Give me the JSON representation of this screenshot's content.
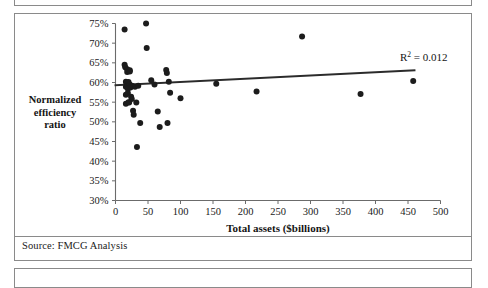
{
  "document": {
    "source_note": "Source: FMCG Analysis"
  },
  "chart_data": {
    "type": "scatter",
    "title": "",
    "xlabel": "Total assets ($billions)",
    "ylabel": "Normalized efficiency ratio",
    "ylabel_lines": [
      "Normalized",
      "efficiency",
      "ratio"
    ],
    "xlim": [
      0,
      500
    ],
    "ylim": [
      30,
      75
    ],
    "xticks": [
      0,
      50,
      100,
      150,
      200,
      250,
      300,
      350,
      400,
      450,
      500
    ],
    "xtick_labels": [
      "0",
      "50",
      "100",
      "150",
      "200",
      "250",
      "300",
      "350",
      "400",
      "450",
      "500"
    ],
    "yticks": [
      30,
      35,
      40,
      45,
      50,
      55,
      60,
      65,
      70,
      75
    ],
    "ytick_labels": [
      "30%",
      "35%",
      "40%",
      "45%",
      "50%",
      "55%",
      "60%",
      "65%",
      "70%",
      "75%"
    ],
    "grid": false,
    "legend": false,
    "annotations": [
      {
        "name": "r2-annotation",
        "text_prefix": "R",
        "text_sup": "2",
        "text_suffix": " = 0.012",
        "value": 0.012
      }
    ],
    "trendline": {
      "type": "linear",
      "x_start": 0,
      "y_start": 59.3,
      "x_end": 460,
      "y_end": 63.1,
      "r_squared": 0.012
    },
    "marker": {
      "shape": "circle",
      "color": "#1c1c1c",
      "size_px": 4.2
    },
    "points": [
      {
        "x": 14,
        "y": 73.5
      },
      {
        "x": 14,
        "y": 64.5
      },
      {
        "x": 15,
        "y": 63.9
      },
      {
        "x": 16,
        "y": 60.2
      },
      {
        "x": 16,
        "y": 58.9
      },
      {
        "x": 16,
        "y": 56.9
      },
      {
        "x": 16,
        "y": 54.6
      },
      {
        "x": 17,
        "y": 59.9
      },
      {
        "x": 18,
        "y": 63.4
      },
      {
        "x": 18,
        "y": 62.7
      },
      {
        "x": 19,
        "y": 59.3
      },
      {
        "x": 19,
        "y": 58.4
      },
      {
        "x": 19,
        "y": 57.3
      },
      {
        "x": 20,
        "y": 60.1
      },
      {
        "x": 20,
        "y": 55.0
      },
      {
        "x": 21,
        "y": 54.9
      },
      {
        "x": 22,
        "y": 63.1
      },
      {
        "x": 22,
        "y": 62.8
      },
      {
        "x": 22,
        "y": 59.5
      },
      {
        "x": 23,
        "y": 58.7
      },
      {
        "x": 24,
        "y": 59.2
      },
      {
        "x": 24,
        "y": 56.4
      },
      {
        "x": 25,
        "y": 55.8
      },
      {
        "x": 26,
        "y": 59.1
      },
      {
        "x": 27,
        "y": 52.8
      },
      {
        "x": 28,
        "y": 51.8
      },
      {
        "x": 30,
        "y": 58.9
      },
      {
        "x": 32,
        "y": 54.9
      },
      {
        "x": 33,
        "y": 43.6
      },
      {
        "x": 35,
        "y": 59.2
      },
      {
        "x": 38,
        "y": 49.7
      },
      {
        "x": 47,
        "y": 75.0
      },
      {
        "x": 48,
        "y": 68.8
      },
      {
        "x": 55,
        "y": 60.6
      },
      {
        "x": 60,
        "y": 59.5
      },
      {
        "x": 65,
        "y": 52.6
      },
      {
        "x": 68,
        "y": 48.7
      },
      {
        "x": 78,
        "y": 63.2
      },
      {
        "x": 79,
        "y": 62.4
      },
      {
        "x": 80,
        "y": 49.7
      },
      {
        "x": 82,
        "y": 60.2
      },
      {
        "x": 84,
        "y": 57.4
      },
      {
        "x": 100,
        "y": 56.0
      },
      {
        "x": 155,
        "y": 59.7
      },
      {
        "x": 217,
        "y": 57.7
      },
      {
        "x": 287,
        "y": 71.7
      },
      {
        "x": 377,
        "y": 57.1
      },
      {
        "x": 458,
        "y": 60.4
      }
    ]
  }
}
